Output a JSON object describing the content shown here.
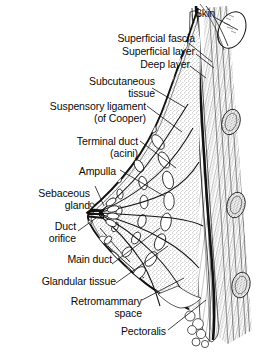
{
  "figure": {
    "type": "anatomical-illustration",
    "style": "black-and-white line engraving with stipple shading",
    "background_color": "#ffffff",
    "ink_color": "#111111"
  },
  "labels": [
    {
      "id": "skin",
      "line1": "Skin",
      "line2": ""
    },
    {
      "id": "superficial-fascia",
      "line1": "Superficial fascia",
      "line2": ""
    },
    {
      "id": "superficial-layer",
      "line1": "Superficial layer",
      "line2": ""
    },
    {
      "id": "deep-layer",
      "line1": "Deep layer",
      "line2": ""
    },
    {
      "id": "subcutaneous-tissue",
      "line1": "Subcutaneous",
      "line2": "tissue"
    },
    {
      "id": "suspensory-ligament",
      "line1": "Suspensory ligament",
      "line2": "(of Cooper)"
    },
    {
      "id": "terminal-duct",
      "line1": "Terminal duct",
      "line2": "(acini)"
    },
    {
      "id": "ampulla",
      "line1": "Ampulla",
      "line2": ""
    },
    {
      "id": "sebaceous-gland",
      "line1": "Sebaceous",
      "line2": "gland"
    },
    {
      "id": "duct-orifice",
      "line1": "Duct",
      "line2": "orifice"
    },
    {
      "id": "main-duct",
      "line1": "Main duct",
      "line2": ""
    },
    {
      "id": "glandular-tissue",
      "line1": "Glandular tissue",
      "line2": ""
    },
    {
      "id": "retromammary-space",
      "line1": "Retromammary",
      "line2": "space"
    },
    {
      "id": "pectoralis",
      "line1": "Pectoralis",
      "line2": ""
    }
  ],
  "structures": [
    "skin surface",
    "nipple and areola",
    "lactiferous ducts radiating from nipple",
    "glandular lobules (acini)",
    "suspensory ligaments of Cooper",
    "subcutaneous fat",
    "retromammary space",
    "pectoralis major muscle",
    "ribs in cross section",
    "intercostal tissue"
  ]
}
